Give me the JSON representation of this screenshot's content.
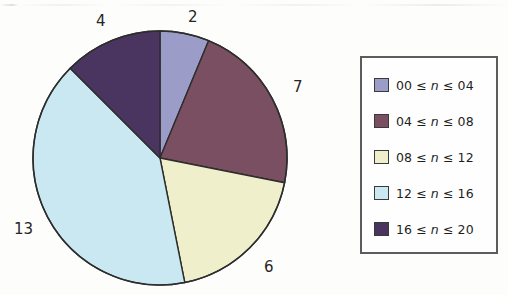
{
  "chart_data": {
    "type": "pie",
    "title": "",
    "categories": [
      "00 ≤ n ≤ 04",
      "04 ≤ n ≤ 08",
      "08 ≤ n ≤ 12",
      "12 ≤ n ≤ 16",
      "16 ≤ n ≤ 20"
    ],
    "values": [
      2,
      7,
      6,
      13,
      4
    ],
    "total": 32,
    "start_angle_deg": 0,
    "direction": "clockwise",
    "legend_position": "right",
    "grid": false,
    "xlabel": "",
    "ylabel": "",
    "colors": [
      "#9b9dc8",
      "#7a4f61",
      "#eff0cb",
      "#c9e8f2",
      "#4a3560"
    ],
    "slices": [
      {
        "label": "00 ≤ n ≤ 04",
        "value": 2,
        "value_text": "2",
        "color": "#9b9dc8",
        "start_deg": 0,
        "end_deg": 22.5,
        "label_x": 188,
        "label_y": 10
      },
      {
        "label": "04 ≤ n ≤ 08",
        "value": 7,
        "value_text": "7",
        "color": "#7a4f61",
        "start_deg": 22.5,
        "end_deg": 101.25,
        "label_x": 293,
        "label_y": 80
      },
      {
        "label": "08 ≤ n ≤ 12",
        "value": 6,
        "value_text": "6",
        "color": "#eff0cb",
        "start_deg": 101.25,
        "end_deg": 168.75,
        "label_x": 264,
        "label_y": 260
      },
      {
        "label": "12 ≤ n ≤ 16",
        "value": 13,
        "value_text": "13",
        "color": "#c9e8f2",
        "start_deg": 168.75,
        "end_deg": 315.0,
        "label_x": 14,
        "label_y": 222
      },
      {
        "label": "16 ≤ n ≤ 20",
        "value": 4,
        "value_text": "4",
        "color": "#4a3560",
        "start_deg": 315.0,
        "end_deg": 360.0,
        "label_x": 96,
        "label_y": 14
      }
    ],
    "geometry": {
      "center_x": 160,
      "center_y": 158,
      "radius": 127,
      "outline_color": "#2d2d2d"
    }
  },
  "legend": {
    "items": [
      {
        "label_html": "00 ≤ <em>n</em> ≤ 04",
        "color": "#9b9dc8"
      },
      {
        "label_html": "04 ≤ <em>n</em> ≤ 08",
        "color": "#7a4f61"
      },
      {
        "label_html": "08 ≤ <em>n</em> ≤ 12",
        "color": "#eff0cb"
      },
      {
        "label_html": "12 ≤ <em>n</em> ≤ 16",
        "color": "#c9e8f2"
      },
      {
        "label_html": "16 ≤ <em>n</em> ≤ 20",
        "color": "#4a3560"
      }
    ]
  }
}
